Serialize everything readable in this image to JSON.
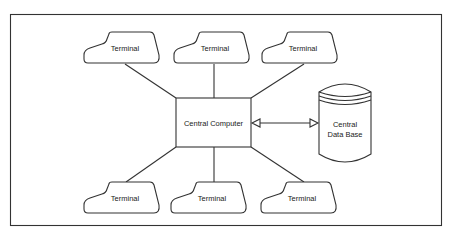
{
  "diagram": {
    "type": "star-network",
    "center": {
      "label": "Central Computer"
    },
    "database": {
      "label_line1": "Central",
      "label_line2": "Data Base"
    },
    "terminals": [
      {
        "label": "Terminal",
        "position": "top-left"
      },
      {
        "label": "Terminal",
        "position": "top-center"
      },
      {
        "label": "Terminal",
        "position": "top-right"
      },
      {
        "label": "Terminal",
        "position": "bottom-left"
      },
      {
        "label": "Terminal",
        "position": "bottom-center"
      },
      {
        "label": "Terminal",
        "position": "bottom-right"
      }
    ],
    "connections": [
      {
        "from": "Central Computer",
        "to": "Terminal (top-left)",
        "style": "line"
      },
      {
        "from": "Central Computer",
        "to": "Terminal (top-center)",
        "style": "line"
      },
      {
        "from": "Central Computer",
        "to": "Terminal (top-right)",
        "style": "line"
      },
      {
        "from": "Central Computer",
        "to": "Terminal (bottom-left)",
        "style": "line"
      },
      {
        "from": "Central Computer",
        "to": "Terminal (bottom-center)",
        "style": "line"
      },
      {
        "from": "Central Computer",
        "to": "Terminal (bottom-right)",
        "style": "line"
      },
      {
        "from": "Central Computer",
        "to": "Central Data Base",
        "style": "double-arrow"
      }
    ]
  }
}
